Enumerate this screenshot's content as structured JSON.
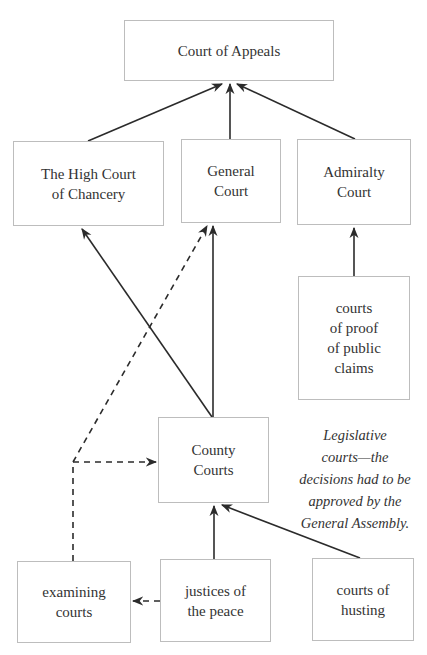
{
  "diagram": {
    "nodes": {
      "appeals": {
        "lines": [
          "Court of Appeals"
        ]
      },
      "chancery": {
        "lines": [
          "The High Court",
          "of Chancery"
        ]
      },
      "general": {
        "lines": [
          "General",
          "Court"
        ]
      },
      "admiralty": {
        "lines": [
          "Admiralty",
          "Court"
        ]
      },
      "proof": {
        "lines": [
          "courts",
          "of proof",
          "of public",
          "claims"
        ]
      },
      "county": {
        "lines": [
          "County",
          "Courts"
        ]
      },
      "examining": {
        "lines": [
          "examining",
          "courts"
        ]
      },
      "justices": {
        "lines": [
          "justices of",
          "the peace"
        ]
      },
      "husting": {
        "lines": [
          "courts of",
          "husting"
        ]
      }
    },
    "edges": [
      {
        "from": "chancery",
        "to": "appeals",
        "style": "solid"
      },
      {
        "from": "general",
        "to": "appeals",
        "style": "solid"
      },
      {
        "from": "admiralty",
        "to": "appeals",
        "style": "solid"
      },
      {
        "from": "proof",
        "to": "admiralty",
        "style": "solid"
      },
      {
        "from": "county",
        "to": "chancery",
        "style": "solid"
      },
      {
        "from": "county",
        "to": "general",
        "style": "solid"
      },
      {
        "from": "justices",
        "to": "county",
        "style": "solid"
      },
      {
        "from": "husting",
        "to": "county",
        "style": "solid"
      },
      {
        "from": "examining",
        "to": "general",
        "style": "dashed"
      },
      {
        "from": "examining",
        "to": "county",
        "style": "dashed"
      },
      {
        "from": "justices",
        "to": "examining",
        "style": "dashed"
      }
    ],
    "note": {
      "lines": [
        "Legislative",
        "courts—the",
        "decisions had to be",
        "approved by the",
        "General Assembly."
      ]
    },
    "colors": {
      "line": "#2b2b2b",
      "box_border": "#bdbdbd",
      "text": "#333333"
    }
  }
}
